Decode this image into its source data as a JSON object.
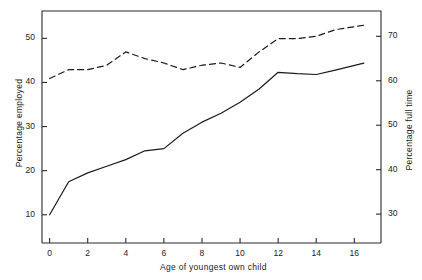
{
  "chart_data": {
    "type": "line",
    "title": "",
    "xlabel": "Age of youngest own child",
    "ylabel": "Percentage employed",
    "ylabel_right": "Percentage full time",
    "xlim": [
      -0.4,
      17.4
    ],
    "ylim": [
      3.6,
      56.2
    ],
    "ylim_right": [
      23.5,
      75.7
    ],
    "grid": false,
    "legend": "none",
    "xticks": [
      0,
      2,
      4,
      6,
      8,
      10,
      12,
      14,
      16
    ],
    "xticklabels": [
      "0",
      "2",
      "4",
      "6",
      "8",
      "10",
      "12",
      "14",
      "16"
    ],
    "yticks": [
      10,
      20,
      30,
      40,
      50
    ],
    "yticklabels": [
      "10",
      "20",
      "30",
      "40",
      "50"
    ],
    "yticks_right": [
      30,
      40,
      50,
      60,
      70
    ],
    "yticklabels_right": [
      "30",
      "40",
      "50",
      "60",
      "70"
    ],
    "x": [
      0,
      1,
      2,
      3,
      4,
      5,
      6,
      7,
      8,
      9,
      10,
      11,
      12,
      13,
      14,
      15,
      16.5
    ],
    "series": [
      {
        "name": "Percentage employed",
        "axis": "left",
        "style": "solid",
        "color": "#1a1a1a",
        "values": [
          10.0,
          17.5,
          19.5,
          21.0,
          22.5,
          24.5,
          25.0,
          28.5,
          31.0,
          33.0,
          35.5,
          38.5,
          42.3,
          42.0,
          41.8,
          42.8,
          44.4
        ]
      },
      {
        "name": "Percentage full time",
        "axis": "right",
        "style": "dashed",
        "color": "#1a1a1a",
        "values": [
          60.5,
          62.5,
          62.5,
          63.5,
          66.5,
          65.0,
          64.0,
          62.5,
          63.5,
          64.0,
          63.0,
          66.5,
          69.5,
          69.5,
          70.0,
          71.5,
          72.5
        ]
      }
    ]
  }
}
